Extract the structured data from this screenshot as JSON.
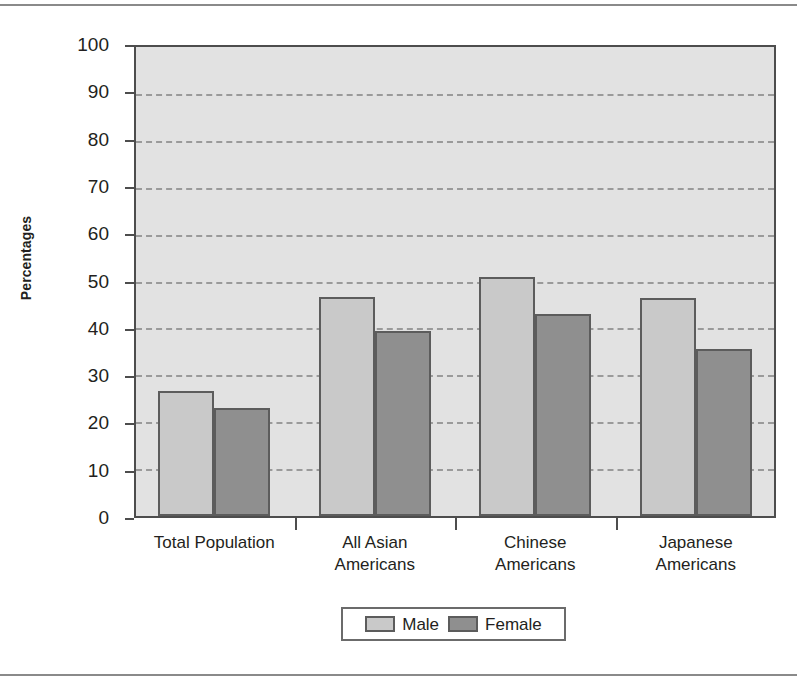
{
  "chart_data": {
    "type": "bar",
    "title": "",
    "xlabel": "",
    "ylabel": "Percentages",
    "ylim": [
      0,
      100
    ],
    "ytick_step": 10,
    "yticks": [
      100,
      90,
      80,
      70,
      60,
      50,
      40,
      30,
      20,
      10,
      0
    ],
    "grid": true,
    "legend_position": "bottom-center",
    "categories": [
      "Total Population",
      "All Asian Americans",
      "Chinese Americans",
      "Japanese Americans"
    ],
    "category_lines": [
      [
        "Total Population",
        ""
      ],
      [
        "All Asian",
        "Americans"
      ],
      [
        "Chinese",
        "Americans"
      ],
      [
        "Japanese",
        "Americans"
      ]
    ],
    "series": [
      {
        "name": "Male",
        "color": "#c9c9c9",
        "values": [
          26.6,
          46.7,
          51.0,
          46.5
        ]
      },
      {
        "name": "Female",
        "color": "#8f8f8f",
        "values": [
          23.0,
          39.5,
          43.0,
          35.7
        ]
      }
    ]
  },
  "colors": {
    "plot_background": "#e2e2e2",
    "axis": "#4d4d4d",
    "gridline": "#9a9a9a",
    "bar_outline": "#5c5c5c",
    "male": "#c9c9c9",
    "female": "#8f8f8f",
    "text": "#231f20",
    "page_rule": "#8a8a8a"
  }
}
